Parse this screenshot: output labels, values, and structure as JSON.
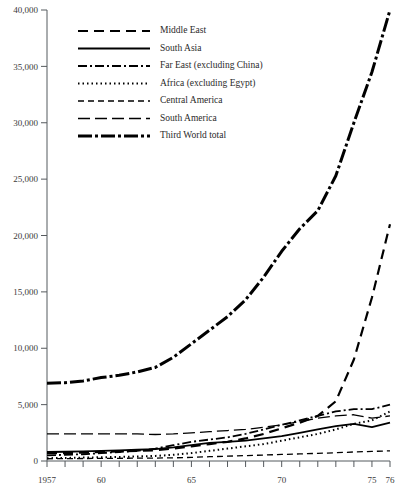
{
  "chart_data": {
    "type": "line",
    "title": "",
    "subtitle": "",
    "xlabel": "",
    "ylabel": "",
    "xlim": [
      1957,
      1976
    ],
    "ylim": [
      0,
      40000
    ],
    "grid": false,
    "legend_position": "top-center",
    "y_ticks": [
      0,
      5000,
      10000,
      15000,
      20000,
      25000,
      30000,
      35000,
      40000
    ],
    "y_tick_labels": [
      "0",
      "5,000",
      "10,000",
      "15,000",
      "20,000",
      "25,000",
      "30,000",
      "35,000",
      "40,000"
    ],
    "x_ticks": [
      1957,
      1958,
      1959,
      1960,
      1961,
      1962,
      1963,
      1964,
      1965,
      1966,
      1967,
      1968,
      1969,
      1970,
      1971,
      1972,
      1973,
      1974,
      1975,
      1976
    ],
    "x_tick_labels": [
      {
        "x": 1957,
        "label": "1957"
      },
      {
        "x": 1960,
        "label": "60"
      },
      {
        "x": 1965,
        "label": "65"
      },
      {
        "x": 1970,
        "label": "70"
      },
      {
        "x": 1975,
        "label": "75"
      },
      {
        "x": 1976,
        "label": "76"
      }
    ],
    "x": [
      1957,
      1958,
      1959,
      1960,
      1961,
      1962,
      1963,
      1964,
      1965,
      1966,
      1967,
      1968,
      1969,
      1970,
      1971,
      1972,
      1973,
      1974,
      1975,
      1976
    ],
    "series": [
      {
        "name": "Middle East",
        "dash": "10,6",
        "width": 2.2,
        "values": [
          700,
          700,
          750,
          800,
          850,
          900,
          950,
          1100,
          1300,
          1500,
          1700,
          2000,
          2400,
          2900,
          3400,
          4000,
          5300,
          9000,
          14500,
          21000
        ]
      },
      {
        "name": "South Asia",
        "dash": "none",
        "width": 1.8,
        "values": [
          800,
          820,
          850,
          900,
          950,
          1000,
          1050,
          1200,
          1400,
          1600,
          1700,
          1800,
          2000,
          2200,
          2500,
          2800,
          3100,
          3300,
          3000,
          3400
        ]
      },
      {
        "name": "Far East (excluding China)",
        "dash": "9,3,2,3",
        "width": 1.8,
        "values": [
          500,
          550,
          600,
          700,
          800,
          900,
          1100,
          1400,
          1700,
          1900,
          2100,
          2400,
          2800,
          3200,
          3600,
          4000,
          4400,
          4600,
          4600,
          5000
        ]
      },
      {
        "name": "Africa (excluding Egypt)",
        "dash": "1.5,3",
        "width": 2.0,
        "values": [
          250,
          270,
          300,
          330,
          360,
          400,
          450,
          550,
          700,
          900,
          1100,
          1300,
          1500,
          1800,
          2100,
          2400,
          2800,
          3300,
          3600,
          4400
        ]
      },
      {
        "name": "Central America",
        "dash": "6,4",
        "width": 1.3,
        "values": [
          200,
          210,
          220,
          230,
          240,
          250,
          260,
          280,
          320,
          380,
          430,
          480,
          530,
          580,
          630,
          680,
          730,
          800,
          850,
          900
        ]
      },
      {
        "name": "South America",
        "dash": "12,5",
        "width": 1.3,
        "values": [
          2400,
          2400,
          2400,
          2400,
          2400,
          2400,
          2350,
          2400,
          2500,
          2600,
          2700,
          2800,
          3000,
          3200,
          3500,
          3800,
          4000,
          4100,
          3800,
          4000
        ]
      },
      {
        "name": "Third World total",
        "dash": "14,3,3,3",
        "width": 3.0,
        "values": [
          6900,
          6950,
          7100,
          7400,
          7600,
          7900,
          8300,
          9200,
          10400,
          11600,
          12800,
          14300,
          16300,
          18600,
          20600,
          22200,
          25300,
          30000,
          34500,
          40000
        ]
      }
    ]
  },
  "legend": {
    "items": [
      {
        "label": "Middle East"
      },
      {
        "label": "South Asia"
      },
      {
        "label": "Far East (excluding China)"
      },
      {
        "label": "Africa (excluding Egypt)"
      },
      {
        "label": "Central America"
      },
      {
        "label": "South America"
      },
      {
        "label": "Third World total"
      }
    ]
  }
}
